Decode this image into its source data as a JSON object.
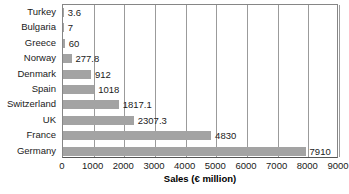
{
  "chart_data": {
    "type": "bar",
    "orientation": "horizontal",
    "title": "",
    "xlabel": "Sales (€ million)",
    "ylabel": "",
    "categories": [
      "Turkey",
      "Bulgaria",
      "Greece",
      "Norway",
      "Denmark",
      "Spain",
      "Switzerland",
      "UK",
      "France",
      "Germany"
    ],
    "values": [
      3.6,
      7,
      60,
      277.8,
      912,
      1018,
      1817.1,
      2307.3,
      4830,
      7910
    ],
    "value_labels": [
      "3.6",
      "7",
      "60",
      "277.8",
      "912",
      "1018",
      "1817.1",
      "2307.3",
      "4830",
      "7910"
    ],
    "xlim": [
      0,
      9000
    ],
    "xticks": [
      0,
      1000,
      2000,
      3000,
      4000,
      5000,
      6000,
      7000,
      8000,
      9000
    ],
    "xtick_labels": [
      "0",
      "1000",
      "2000",
      "3000",
      "4000",
      "5000",
      "6000",
      "7000",
      "8000",
      "9000"
    ],
    "grid": "vertical",
    "legend": null,
    "bar_color": "#a3a3a3",
    "gridline_color": "#9b9b9b",
    "axis_color": "#555555",
    "text_color": "#1a1a1a"
  }
}
